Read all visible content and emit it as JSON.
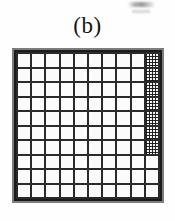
{
  "figure": {
    "caption": "(b)",
    "type": "grid-lattice-diagram"
  },
  "grid": {
    "columns": 10,
    "rows": 10,
    "total_cells": 100,
    "filled_cells_count": 7,
    "filled_description": "top seven cells of the rightmost column",
    "line_color": "#1b1b1b",
    "cell_color": "#fbfbfb",
    "fill_color": "#141414",
    "fill_pattern": "dotted-halftone",
    "cells": [
      [
        0,
        0,
        0,
        0,
        0,
        0,
        0,
        0,
        0,
        1
      ],
      [
        0,
        0,
        0,
        0,
        0,
        0,
        0,
        0,
        0,
        1
      ],
      [
        0,
        0,
        0,
        0,
        0,
        0,
        0,
        0,
        0,
        1
      ],
      [
        0,
        0,
        0,
        0,
        0,
        0,
        0,
        0,
        0,
        1
      ],
      [
        0,
        0,
        0,
        0,
        0,
        0,
        0,
        0,
        0,
        1
      ],
      [
        0,
        0,
        0,
        0,
        0,
        0,
        0,
        0,
        0,
        1
      ],
      [
        0,
        0,
        0,
        0,
        0,
        0,
        0,
        0,
        0,
        1
      ],
      [
        0,
        0,
        0,
        0,
        0,
        0,
        0,
        0,
        0,
        0
      ],
      [
        0,
        0,
        0,
        0,
        0,
        0,
        0,
        0,
        0,
        0
      ],
      [
        0,
        0,
        0,
        0,
        0,
        0,
        0,
        0,
        0,
        0
      ]
    ]
  },
  "artifacts": {
    "top_right_smudge": "faint scan artifact"
  }
}
